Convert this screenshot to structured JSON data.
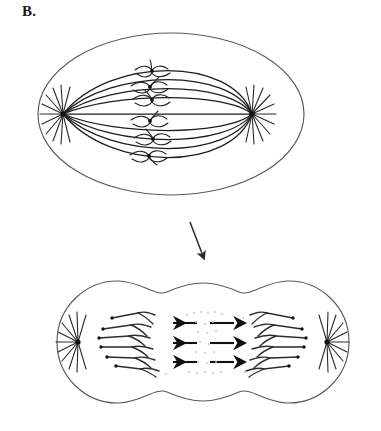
{
  "figure": {
    "panel_label": "B.",
    "alt_description": "Line drawing of cell division: metaphase cell above and anaphase/cytokinesis cell below, joined by a downward arrow.",
    "background_color": "#ffffff",
    "line_color": "#3a3a3a",
    "ink_color": "#111111",
    "faint_color": "#b9b9b9"
  },
  "stage_top": {
    "name": "metaphase-cell",
    "cell_shape": "oval",
    "chromosome_pair_count": 6,
    "poles": [
      {
        "name": "left-pole",
        "label": ""
      },
      {
        "name": "right-pole",
        "label": ""
      }
    ],
    "structures": [
      {
        "name": "cell-membrane",
        "label": ""
      },
      {
        "name": "spindle-fibers",
        "label": ""
      },
      {
        "name": "metaphase-plate-chromosomes",
        "label": ""
      },
      {
        "name": "centrosome",
        "label": ""
      },
      {
        "name": "aster-rays",
        "label": ""
      }
    ]
  },
  "transition": {
    "name": "progression-arrow",
    "direction": "down",
    "label": ""
  },
  "stage_bottom": {
    "name": "anaphase-cytokinesis-cell",
    "cell_shape": "dumbbell",
    "chromosome_group_count": 6,
    "movement_arrow_count": 6,
    "movement_arrow_rows": 3,
    "poles": [
      {
        "name": "left-pole",
        "label": ""
      },
      {
        "name": "right-pole",
        "label": ""
      }
    ],
    "structures": [
      {
        "name": "cleavage-furrow",
        "label": ""
      },
      {
        "name": "separating-chromosomes",
        "label": ""
      },
      {
        "name": "movement-arrows-left",
        "label": ""
      },
      {
        "name": "movement-arrows-right",
        "label": ""
      },
      {
        "name": "residual-dots",
        "label": ""
      }
    ]
  }
}
